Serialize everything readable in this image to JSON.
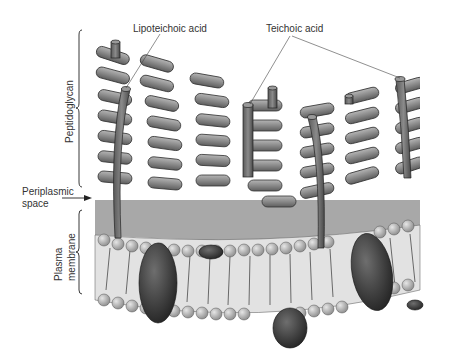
{
  "diagram": {
    "labels": {
      "lipoteichoic_acid": "Lipoteichoic acid",
      "teichoic_acid": "Teichoic acid",
      "peptidoglycan": "Peptidoglycan",
      "periplasmic_space_line1": "Periplasmic",
      "periplasmic_space_line2": "space",
      "plasma_membrane_line1": "Plasma",
      "plasma_membrane_line2": "membrane"
    },
    "colors": {
      "peptidoglycan_fill": "#8a8a8a",
      "periplasm_fill": "#a8a8a8",
      "membrane_head": "#bdbdbd",
      "protein_fill": "#3a3a3a",
      "teichoic_fill": "#6a6a6a",
      "background": "#ffffff"
    }
  }
}
